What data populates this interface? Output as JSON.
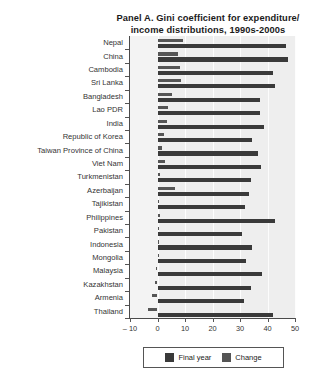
{
  "top_strip_text": "",
  "title": {
    "line1": "Panel A. Gini coefficient for expenditure/",
    "line2": "income distributions, 1990s-2000s"
  },
  "legend": {
    "items": [
      {
        "label": "Final year",
        "color": "#3a3a3a",
        "name": "legend-final-year"
      },
      {
        "label": "Change",
        "color": "#555555",
        "name": "legend-change"
      }
    ]
  },
  "chart_data": {
    "type": "bar",
    "orientation": "horizontal",
    "xlabel": "",
    "ylabel": "",
    "xlim": [
      -10,
      50
    ],
    "xticks": [
      -10,
      0,
      10,
      20,
      30,
      40,
      50
    ],
    "xticklabels": [
      "– 10",
      "0",
      "10",
      "20",
      "30",
      "40",
      "50"
    ],
    "grid": true,
    "grid_axis": "x",
    "legend_position": "bottom",
    "categories": [
      "Nepal",
      "China",
      "Cambodia",
      "Sri Lanka",
      "Bangladesh",
      "Lao PDR",
      "India",
      "Republic of Korea",
      "Taiwan Province of China",
      "Viet Nam",
      "Turkmenistan",
      "Azerbaijan",
      "Tajikistan",
      "Philippines",
      "Pakistan",
      "Indonesia",
      "Mongolia",
      "Malaysia",
      "Kazakhstan",
      "Armenia",
      "Thailand"
    ],
    "series": [
      {
        "name": "Final year",
        "color": "#3a3a3a",
        "values": [
          46.9,
          47.4,
          41.9,
          42.8,
          37.3,
          37.4,
          38.6,
          34.5,
          36.6,
          37.8,
          34.1,
          33.1,
          31.9,
          42.9,
          30.7,
          34.2,
          32.0,
          37.9,
          33.9,
          31.5,
          42.0
        ]
      },
      {
        "name": "Change",
        "color": "#555555",
        "values": [
          9.4,
          7.4,
          8.0,
          8.6,
          5.2,
          3.8,
          3.4,
          2.2,
          1.6,
          2.6,
          1.0,
          6.2,
          0.5,
          0.9,
          0.6,
          0.3,
          0.1,
          -0.4,
          -0.9,
          -1.9,
          -3.6
        ]
      }
    ]
  }
}
